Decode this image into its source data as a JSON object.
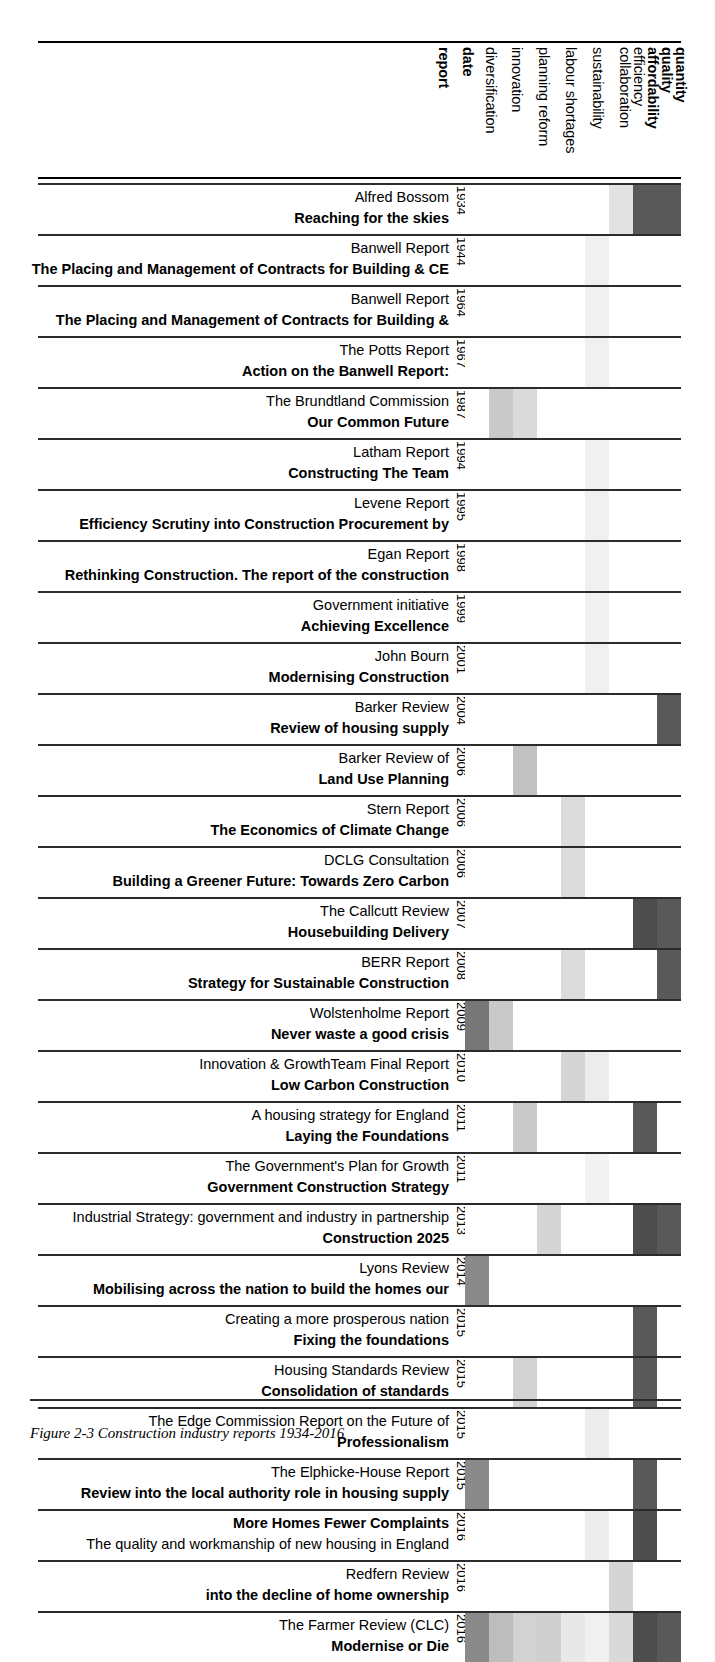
{
  "figure": {
    "caption": "Figure 2-3 Construction industry reports 1934-2016"
  },
  "columns": [
    {
      "key": "report",
      "label": "report",
      "bold": true,
      "x": 436
    },
    {
      "key": "date",
      "label": "date",
      "bold": true,
      "x": 460
    },
    {
      "key": "diversification",
      "label": "diversification",
      "bold": false,
      "x": 483
    },
    {
      "key": "innovation",
      "label": "innovation",
      "bold": false,
      "x": 509
    },
    {
      "key": "planning_reform",
      "label": "planning reform",
      "bold": false,
      "x": 536
    },
    {
      "key": "labour_shortages",
      "label": "labour shortages",
      "bold": false,
      "x": 563
    },
    {
      "key": "sustainability",
      "label": "sustainability",
      "bold": false,
      "x": 590
    },
    {
      "key": "collaboration",
      "label": "collaboration",
      "bold": false,
      "x": 617
    },
    {
      "key": "efficiency",
      "label": "efficiency",
      "bold": false,
      "x": 617
    },
    {
      "key": "affordability",
      "label": "affordability",
      "bold": true,
      "x": 644
    },
    {
      "key": "quality",
      "label": "quality",
      "bold": true,
      "x": 658
    },
    {
      "key": "quantity",
      "label": "quantity",
      "bold": true,
      "x": 672
    }
  ],
  "header_labels": [
    {
      "label": "report",
      "bold": true
    },
    {
      "label": "date",
      "bold": true
    },
    {
      "label": "diversification",
      "bold": false
    },
    {
      "label": "innovation",
      "bold": false
    },
    {
      "label": "planning reform",
      "bold": false
    },
    {
      "label": "labour shortages",
      "bold": false
    },
    {
      "label": "sustainability",
      "bold": false
    },
    {
      "label": "collaboration",
      "bold": false
    },
    {
      "label": "efficiency",
      "bold": false
    },
    {
      "label": "affordability",
      "bold": true
    },
    {
      "label": "quality",
      "bold": true
    },
    {
      "label": "quantity",
      "bold": true
    }
  ],
  "theme_columns": [
    "diversification",
    "innovation",
    "planning reform",
    "labour shortages",
    "sustainability",
    "collaboration",
    "efficiency",
    "affordability",
    "quality",
    "quantity"
  ],
  "data_columns": [
    "diversification",
    "innovation",
    "planning reform",
    "labour shortages",
    "sustainability",
    "collaboration",
    "efficiency",
    "affordability+quality",
    "quantity"
  ],
  "palette": {
    "white": "#ffffff",
    "very_light": "#f2f2f2",
    "light": "#e6e6e6",
    "light_mid": "#d9d9d9",
    "mid": "#cccccc",
    "mid_dark": "#b3b3b3",
    "grey": "#a6a6a6",
    "dark": "#595959",
    "darker": "#4d4d4d",
    "rule": "#2b2b2b"
  },
  "rows": [
    {
      "author": "Alfred Bossom",
      "title": "Reaching for the skies",
      "date": "1934",
      "title_first": false,
      "cells": [
        "#ffffff",
        "#ffffff",
        "#ffffff",
        "#ffffff",
        "#ffffff",
        "#ffffff",
        "#e2e2e2",
        "#595959",
        "#595959"
      ]
    },
    {
      "author": "Banwell Report",
      "title": "The Placing and Management of Contracts for Building & CE",
      "date": "1944",
      "title_first": false,
      "cells": [
        "#ffffff",
        "#ffffff",
        "#ffffff",
        "#ffffff",
        "#ffffff",
        "#f0f0f0",
        "#ffffff",
        "#ffffff",
        "#ffffff"
      ]
    },
    {
      "author": "Banwell Report",
      "title": "The Placing and Management of Contracts for Building &",
      "date": "1964",
      "title_first": false,
      "cells": [
        "#ffffff",
        "#ffffff",
        "#ffffff",
        "#ffffff",
        "#ffffff",
        "#f0f0f0",
        "#ffffff",
        "#ffffff",
        "#ffffff"
      ]
    },
    {
      "author": "The Potts Report",
      "title": "Action on the Banwell Report:",
      "date": "1967",
      "title_first": false,
      "cells": [
        "#ffffff",
        "#ffffff",
        "#ffffff",
        "#ffffff",
        "#ffffff",
        "#f0f0f0",
        "#ffffff",
        "#ffffff",
        "#ffffff"
      ]
    },
    {
      "author": "The Brundtland Commission",
      "title": "Our Common Future",
      "date": "1987",
      "title_first": false,
      "cells": [
        "#ffffff",
        "#c9c9c9",
        "#dadada",
        "#ffffff",
        "#ffffff",
        "#ffffff",
        "#ffffff",
        "#ffffff",
        "#ffffff"
      ]
    },
    {
      "author": "Latham Report",
      "title": "Constructing The Team",
      "date": "1994",
      "title_first": false,
      "cells": [
        "#ffffff",
        "#ffffff",
        "#ffffff",
        "#ffffff",
        "#ffffff",
        "#f0f0f0",
        "#ffffff",
        "#ffffff",
        "#ffffff"
      ]
    },
    {
      "author": "Levene Report",
      "title": "Efficiency Scrutiny into Construction Procurement by",
      "date": "1995",
      "title_first": false,
      "cells": [
        "#ffffff",
        "#ffffff",
        "#ffffff",
        "#ffffff",
        "#ffffff",
        "#f0f0f0",
        "#ffffff",
        "#ffffff",
        "#ffffff"
      ]
    },
    {
      "author": "Egan Report",
      "title": "Rethinking Construction. The report of the construction",
      "date": "1998",
      "title_first": false,
      "cells": [
        "#ffffff",
        "#ffffff",
        "#ffffff",
        "#ffffff",
        "#ffffff",
        "#f0f0f0",
        "#ffffff",
        "#ffffff",
        "#ffffff"
      ]
    },
    {
      "author": "Government initiative",
      "title": "Achieving Excellence",
      "date": "1999",
      "title_first": false,
      "cells": [
        "#ffffff",
        "#ffffff",
        "#ffffff",
        "#ffffff",
        "#ffffff",
        "#f0f0f0",
        "#ffffff",
        "#ffffff",
        "#ffffff"
      ]
    },
    {
      "author": "John Bourn",
      "title": "Modernising Construction",
      "date": "2001",
      "title_first": false,
      "cells": [
        "#ffffff",
        "#ffffff",
        "#ffffff",
        "#ffffff",
        "#ffffff",
        "#f0f0f0",
        "#ffffff",
        "#ffffff",
        "#ffffff"
      ]
    },
    {
      "author": "Barker Review",
      "title": "Review of housing supply",
      "date": "2004",
      "title_first": false,
      "cells": [
        "#ffffff",
        "#ffffff",
        "#ffffff",
        "#ffffff",
        "#ffffff",
        "#ffffff",
        "#ffffff",
        "#ffffff",
        "#595959"
      ]
    },
    {
      "author": "Barker Review of",
      "title": "Land Use Planning",
      "date": "2006",
      "title_first": false,
      "cells": [
        "#ffffff",
        "#ffffff",
        "#c2c2c2",
        "#ffffff",
        "#ffffff",
        "#ffffff",
        "#ffffff",
        "#ffffff",
        "#ffffff"
      ]
    },
    {
      "author": "Stern Report",
      "title": "The Economics of Climate Change",
      "date": "2006",
      "title_first": false,
      "cells": [
        "#ffffff",
        "#ffffff",
        "#ffffff",
        "#ffffff",
        "#dcdcdc",
        "#ffffff",
        "#ffffff",
        "#ffffff",
        "#ffffff"
      ]
    },
    {
      "author": "DCLG Consultation",
      "title": "Building a Greener Future: Towards Zero Carbon",
      "date": "2006",
      "title_first": false,
      "cells": [
        "#ffffff",
        "#ffffff",
        "#ffffff",
        "#ffffff",
        "#dcdcdc",
        "#ffffff",
        "#ffffff",
        "#ffffff",
        "#ffffff"
      ]
    },
    {
      "author": "The Callcutt Review",
      "title": "Housebuilding Delivery",
      "date": "2007",
      "title_first": false,
      "cells": [
        "#ffffff",
        "#ffffff",
        "#ffffff",
        "#ffffff",
        "#ffffff",
        "#ffffff",
        "#ffffff",
        "#4d4d4d",
        "#595959"
      ]
    },
    {
      "author": "BERR Report",
      "title": "Strategy for Sustainable Construction",
      "date": "2008",
      "title_first": false,
      "cells": [
        "#ffffff",
        "#ffffff",
        "#ffffff",
        "#ffffff",
        "#dcdcdc",
        "#ffffff",
        "#ffffff",
        "#ffffff",
        "#595959"
      ]
    },
    {
      "author": "Wolstenholme Report",
      "title": "Never waste a good crisis",
      "date": "2009",
      "title_first": false,
      "cells": [
        "#777777",
        "#c9c9c9",
        "#ffffff",
        "#ffffff",
        "#ffffff",
        "#ffffff",
        "#ffffff",
        "#ffffff",
        "#ffffff"
      ]
    },
    {
      "author": "Innovation & GrowthTeam Final Report",
      "title": "Low Carbon Construction",
      "date": "2010",
      "title_first": false,
      "cells": [
        "#ffffff",
        "#ffffff",
        "#ffffff",
        "#ffffff",
        "#d5d5d5",
        "#ececec",
        "#ffffff",
        "#ffffff",
        "#ffffff"
      ]
    },
    {
      "author": "A housing strategy for England",
      "title": "Laying the Foundations",
      "date": "2011",
      "title_first": false,
      "cells": [
        "#ffffff",
        "#ffffff",
        "#c9c9c9",
        "#ffffff",
        "#ffffff",
        "#ffffff",
        "#ffffff",
        "#595959",
        "#ffffff"
      ]
    },
    {
      "author": "The Government's Plan for Growth",
      "title": "Government Construction Strategy",
      "date": "2011",
      "title_first": false,
      "cells": [
        "#ffffff",
        "#ffffff",
        "#ffffff",
        "#ffffff",
        "#ffffff",
        "#f3f3f3",
        "#ffffff",
        "#ffffff",
        "#ffffff"
      ]
    },
    {
      "author": "Industrial Strategy: government and industry in partnership",
      "title": "Construction 2025",
      "date": "2013",
      "title_first": false,
      "cells": [
        "#ffffff",
        "#ffffff",
        "#ffffff",
        "#d5d5d5",
        "#ffffff",
        "#ffffff",
        "#ffffff",
        "#4d4d4d",
        "#595959"
      ]
    },
    {
      "author": "Lyons Review",
      "title": "Mobilising across the nation to build the homes our",
      "date": "2014",
      "title_first": false,
      "cells": [
        "#8a8a8a",
        "#ffffff",
        "#ffffff",
        "#ffffff",
        "#ffffff",
        "#ffffff",
        "#ffffff",
        "#ffffff",
        "#ffffff"
      ]
    },
    {
      "author": "Creating a more prosperous nation",
      "title": "Fixing the foundations",
      "date": "2015",
      "title_first": false,
      "cells": [
        "#ffffff",
        "#ffffff",
        "#ffffff",
        "#ffffff",
        "#ffffff",
        "#ffffff",
        "#ffffff",
        "#595959",
        "#ffffff"
      ]
    },
    {
      "author": "Housing Standards Review",
      "title": "Consolidation of standards",
      "date": "2015",
      "title_first": false,
      "cells": [
        "#ffffff",
        "#ffffff",
        "#d2d2d2",
        "#ffffff",
        "#ffffff",
        "#ffffff",
        "#ffffff",
        "#595959",
        "#ffffff"
      ]
    },
    {
      "author": "The Edge Commission Report on the Future of",
      "title": "Professionalism",
      "date": "2015",
      "title_first": false,
      "cells": [
        "#ffffff",
        "#ffffff",
        "#ffffff",
        "#ffffff",
        "#ffffff",
        "#ececec",
        "#ffffff",
        "#ffffff",
        "#ffffff"
      ]
    },
    {
      "author": "The Elphicke-House Report",
      "title": "Review into the local authority role in housing supply",
      "date": "2015",
      "title_first": false,
      "cells": [
        "#8a8a8a",
        "#ffffff",
        "#ffffff",
        "#ffffff",
        "#ffffff",
        "#ffffff",
        "#ffffff",
        "#595959",
        "#ffffff"
      ]
    },
    {
      "author": "The quality and workmanship of new housing in England",
      "title": "More Homes Fewer Complaints",
      "date": "2016",
      "title_first": true,
      "cells": [
        "#ffffff",
        "#ffffff",
        "#ffffff",
        "#ffffff",
        "#ffffff",
        "#ececec",
        "#ffffff",
        "#4d4d4d",
        "#ffffff"
      ]
    },
    {
      "author": "Redfern Review",
      "title": "into the decline of home ownership",
      "date": "2016",
      "title_first": false,
      "cells": [
        "#ffffff",
        "#ffffff",
        "#ffffff",
        "#ffffff",
        "#ffffff",
        "#ffffff",
        "#d5d5d5",
        "#ffffff",
        "#ffffff"
      ]
    },
    {
      "author": "The Farmer Review (CLC)",
      "title": "Modernise or Die",
      "date": "2016",
      "title_first": false,
      "cells": [
        "#8a8a8a",
        "#bdbdbd",
        "#d2d2d2",
        "#cfcfcf",
        "#e8e8e8",
        "#f0f0f0",
        "#d9d9d9",
        "#4d4d4d",
        "#595959"
      ]
    }
  ]
}
